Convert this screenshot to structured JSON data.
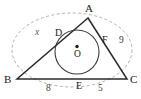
{
  "figure": {
    "vertices": [
      {
        "name": "A",
        "label": "A",
        "x": 88,
        "y": 18
      },
      {
        "name": "B",
        "label": "B",
        "x": 17,
        "y": 79
      },
      {
        "name": "C",
        "label": "C",
        "x": 127,
        "y": 79
      }
    ],
    "tangent_points": [
      {
        "name": "D",
        "label": "D",
        "x": 62,
        "y": 35
      },
      {
        "name": "F",
        "label": "F",
        "x": 104,
        "y": 41
      },
      {
        "name": "E",
        "label": "E",
        "x": 79,
        "y": 79
      }
    ],
    "center": {
      "name": "O",
      "label": "O",
      "x": 77,
      "y": 52,
      "radius": 22
    },
    "measures": [
      {
        "name": "side-AB",
        "label": "x",
        "x": 38,
        "y": 32,
        "style": "variable"
      },
      {
        "name": "side-AC",
        "label": "9",
        "x": 122,
        "y": 41,
        "style": "number"
      },
      {
        "name": "segment-BE",
        "label": "8",
        "x": 48,
        "y": 89,
        "style": "number"
      },
      {
        "name": "segment-EC",
        "label": "5",
        "x": 100,
        "y": 89,
        "style": "number"
      }
    ],
    "colors": {
      "stroke": "#2b2b2b",
      "dashed": "#9a9a9a",
      "incircle": "#3a3a3a",
      "background": "#ffffff"
    },
    "geometry": {
      "triangle_path": "M 88 18 L 17 79 L 127 79 Z",
      "incircle": {
        "cx": 77,
        "cy": 52,
        "r": 22
      },
      "circumscribed_dashed": {
        "cx": 72,
        "cy": 50,
        "rx": 60,
        "ry": 38
      },
      "center_dot": {
        "cx": 77,
        "cy": 46,
        "r": 1.6
      }
    }
  }
}
